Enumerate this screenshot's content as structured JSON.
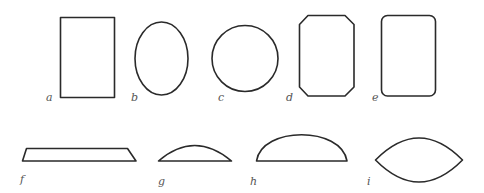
{
  "figure": {
    "stroke_color": "#2a2a2a",
    "label_color": "#555555",
    "shapes": [
      {
        "label": "a",
        "kind": "rectangle"
      },
      {
        "label": "b",
        "kind": "ellipse"
      },
      {
        "label": "c",
        "kind": "circle"
      },
      {
        "label": "d",
        "kind": "octagon (rectangle with chamfered corners)"
      },
      {
        "label": "e",
        "kind": "rounded rectangle"
      },
      {
        "label": "f",
        "kind": "flat trapezoid"
      },
      {
        "label": "g",
        "kind": "shallow circular segment"
      },
      {
        "label": "h",
        "kind": "deep circular segment"
      },
      {
        "label": "i",
        "kind": "lens / vesica"
      }
    ]
  }
}
